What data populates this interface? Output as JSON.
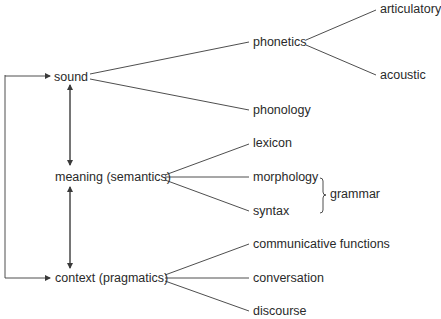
{
  "diagram": {
    "type": "tree",
    "levels": [
      {
        "id": "sound",
        "label": "sound",
        "children": [
          {
            "id": "phonetics",
            "label": "phonetics",
            "children": [
              {
                "id": "articulatory",
                "label": "articulatory"
              },
              {
                "id": "acoustic",
                "label": "acoustic"
              }
            ]
          },
          {
            "id": "phonology",
            "label": "phonology"
          }
        ]
      },
      {
        "id": "meaning",
        "label": "meaning (semantics)",
        "children": [
          {
            "id": "lexicon",
            "label": "lexicon"
          },
          {
            "id": "morphology",
            "label": "morphology"
          },
          {
            "id": "syntax",
            "label": "syntax"
          }
        ]
      },
      {
        "id": "context",
        "label": "context (pragmatics)",
        "children": [
          {
            "id": "communicative",
            "label": "communicative functions"
          },
          {
            "id": "conversation",
            "label": "conversation"
          },
          {
            "id": "discourse",
            "label": "discourse"
          }
        ]
      }
    ],
    "grouping": {
      "label": "grammar",
      "members": [
        "morphology",
        "syntax"
      ]
    },
    "relations": [
      {
        "from": "sound",
        "to": "meaning",
        "kind": "bidirectional"
      },
      {
        "from": "meaning",
        "to": "context",
        "kind": "bidirectional"
      },
      {
        "from": "context",
        "to": "sound",
        "kind": "loop-arrows"
      }
    ]
  },
  "labels": {
    "sound": "sound",
    "meaning": "meaning (semantics)",
    "context": "context (pragmatics)",
    "phonetics": "phonetics",
    "articulatory": "articulatory",
    "acoustic": "acoustic",
    "phonology": "phonology",
    "lexicon": "lexicon",
    "morphology": "morphology",
    "syntax": "syntax",
    "grammar": "grammar",
    "communicative": "communicative functions",
    "conversation": "conversation",
    "discourse": "discourse"
  },
  "colors": {
    "line": "#3a3a3a",
    "text": "#2a2a2a",
    "background": "#ffffff"
  }
}
